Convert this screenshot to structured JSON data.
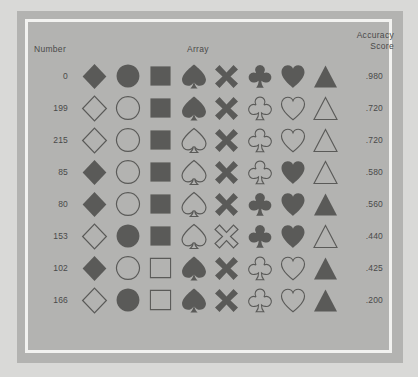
{
  "figure": {
    "header_number": "Number",
    "header_array": "Array",
    "header_accuracy_line1": "Accuracy",
    "header_accuracy_line2": "Score",
    "ink_color": "#5a5a58",
    "panel_color": "#b3b3b1",
    "frame_color": "#f2f2f0",
    "text_color": "#4a4a4a"
  },
  "columns": [
    "diamond",
    "circle",
    "square",
    "spade",
    "x",
    "club",
    "heart",
    "triangle"
  ],
  "rows": [
    {
      "number": "0",
      "score": ".980",
      "shapes": [
        {
          "icon": "diamond-icon",
          "fill": "filled"
        },
        {
          "icon": "circle-icon",
          "fill": "filled"
        },
        {
          "icon": "square-icon",
          "fill": "filled"
        },
        {
          "icon": "spade-icon",
          "fill": "filled"
        },
        {
          "icon": "x-icon",
          "fill": "filled"
        },
        {
          "icon": "club-icon",
          "fill": "filled"
        },
        {
          "icon": "heart-icon",
          "fill": "filled"
        },
        {
          "icon": "triangle-icon",
          "fill": "filled"
        }
      ]
    },
    {
      "number": "199",
      "score": ".720",
      "shapes": [
        {
          "icon": "diamond-icon",
          "fill": "outline"
        },
        {
          "icon": "circle-icon",
          "fill": "outline"
        },
        {
          "icon": "square-icon",
          "fill": "filled"
        },
        {
          "icon": "spade-icon",
          "fill": "filled"
        },
        {
          "icon": "x-icon",
          "fill": "filled"
        },
        {
          "icon": "club-icon",
          "fill": "outline"
        },
        {
          "icon": "heart-icon",
          "fill": "outline"
        },
        {
          "icon": "triangle-icon",
          "fill": "outline"
        }
      ]
    },
    {
      "number": "215",
      "score": ".720",
      "shapes": [
        {
          "icon": "diamond-icon",
          "fill": "outline"
        },
        {
          "icon": "circle-icon",
          "fill": "outline"
        },
        {
          "icon": "square-icon",
          "fill": "filled"
        },
        {
          "icon": "spade-icon",
          "fill": "outline"
        },
        {
          "icon": "x-icon",
          "fill": "filled"
        },
        {
          "icon": "club-icon",
          "fill": "outline"
        },
        {
          "icon": "heart-icon",
          "fill": "outline"
        },
        {
          "icon": "triangle-icon",
          "fill": "outline"
        }
      ]
    },
    {
      "number": "85",
      "score": ".580",
      "shapes": [
        {
          "icon": "diamond-icon",
          "fill": "filled"
        },
        {
          "icon": "circle-icon",
          "fill": "outline"
        },
        {
          "icon": "square-icon",
          "fill": "filled"
        },
        {
          "icon": "spade-icon",
          "fill": "outline"
        },
        {
          "icon": "x-icon",
          "fill": "filled"
        },
        {
          "icon": "club-icon",
          "fill": "outline"
        },
        {
          "icon": "heart-icon",
          "fill": "filled"
        },
        {
          "icon": "triangle-icon",
          "fill": "outline"
        }
      ]
    },
    {
      "number": "80",
      "score": ".560",
      "shapes": [
        {
          "icon": "diamond-icon",
          "fill": "filled"
        },
        {
          "icon": "circle-icon",
          "fill": "outline"
        },
        {
          "icon": "square-icon",
          "fill": "filled"
        },
        {
          "icon": "spade-icon",
          "fill": "outline"
        },
        {
          "icon": "x-icon",
          "fill": "filled"
        },
        {
          "icon": "club-icon",
          "fill": "filled"
        },
        {
          "icon": "heart-icon",
          "fill": "filled"
        },
        {
          "icon": "triangle-icon",
          "fill": "filled"
        }
      ]
    },
    {
      "number": "153",
      "score": ".440",
      "shapes": [
        {
          "icon": "diamond-icon",
          "fill": "outline"
        },
        {
          "icon": "circle-icon",
          "fill": "filled"
        },
        {
          "icon": "square-icon",
          "fill": "filled"
        },
        {
          "icon": "spade-icon",
          "fill": "outline"
        },
        {
          "icon": "x-icon",
          "fill": "outline"
        },
        {
          "icon": "club-icon",
          "fill": "filled"
        },
        {
          "icon": "heart-icon",
          "fill": "filled"
        },
        {
          "icon": "triangle-icon",
          "fill": "outline"
        }
      ]
    },
    {
      "number": "102",
      "score": ".425",
      "shapes": [
        {
          "icon": "diamond-icon",
          "fill": "filled"
        },
        {
          "icon": "circle-icon",
          "fill": "outline"
        },
        {
          "icon": "square-icon",
          "fill": "outline"
        },
        {
          "icon": "spade-icon",
          "fill": "filled"
        },
        {
          "icon": "x-icon",
          "fill": "filled"
        },
        {
          "icon": "club-icon",
          "fill": "outline"
        },
        {
          "icon": "heart-icon",
          "fill": "outline"
        },
        {
          "icon": "triangle-icon",
          "fill": "filled"
        }
      ]
    },
    {
      "number": "166",
      "score": ".200",
      "shapes": [
        {
          "icon": "diamond-icon",
          "fill": "outline"
        },
        {
          "icon": "circle-icon",
          "fill": "filled"
        },
        {
          "icon": "square-icon",
          "fill": "outline"
        },
        {
          "icon": "spade-icon",
          "fill": "filled"
        },
        {
          "icon": "x-icon",
          "fill": "filled"
        },
        {
          "icon": "club-icon",
          "fill": "outline"
        },
        {
          "icon": "heart-icon",
          "fill": "outline"
        },
        {
          "icon": "triangle-icon",
          "fill": "filled"
        }
      ]
    }
  ]
}
